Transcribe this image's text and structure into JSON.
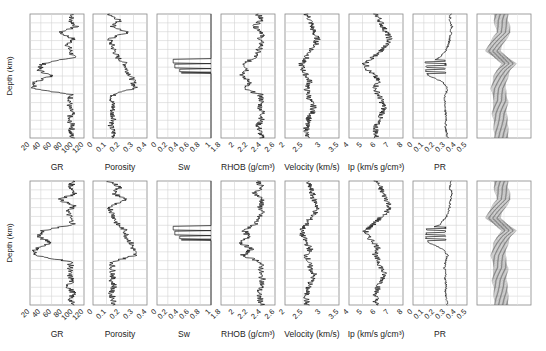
{
  "chart_data": {
    "type": "line",
    "title": "",
    "layout": {
      "rows": 2,
      "columns": 8,
      "grid": true,
      "legend": "none",
      "ylabel": "Depth (km)",
      "y_reversed": true
    },
    "tracks": [
      {
        "name": "GR",
        "xlabel": "GR",
        "xlim": [
          20,
          120
        ],
        "ticks": [
          "20",
          "40",
          "60",
          "80",
          "100",
          "120"
        ]
      },
      {
        "name": "Porosity",
        "xlabel": "Porosity",
        "xlim": [
          0,
          0.4
        ],
        "ticks": [
          "0",
          "0.1",
          "0.2",
          "0.3",
          "0.4"
        ]
      },
      {
        "name": "Sw",
        "xlabel": "Sw",
        "xlim": [
          0,
          1
        ],
        "ticks": [
          "0",
          "0.2",
          "0.4",
          "0.6",
          "0.8",
          "1"
        ]
      },
      {
        "name": "RHOB",
        "xlabel": "RHOB (g/cm³)",
        "xlim": [
          1.8,
          2.6
        ],
        "ticks": [
          "1.8",
          "2",
          "2.2",
          "2.4",
          "2.6"
        ]
      },
      {
        "name": "Velocity",
        "xlabel": "Velocity (km/s)",
        "xlim": [
          2,
          3.5
        ],
        "ticks": [
          "2",
          "2.5",
          "3",
          "3.5"
        ]
      },
      {
        "name": "Ip",
        "xlabel": "Ip (km/s g/cm³)",
        "xlim": [
          4,
          8
        ],
        "ticks": [
          "4",
          "5",
          "6",
          "7",
          "8"
        ]
      },
      {
        "name": "PR",
        "xlabel": "PR",
        "xlim": [
          0,
          0.5
        ],
        "ticks": [
          "0",
          "0.1",
          "0.2",
          "0.3",
          "0.4",
          "0.5"
        ]
      },
      {
        "name": "Seismic",
        "xlabel": "",
        "xlim": [
          0,
          1
        ],
        "ticks": []
      }
    ],
    "depth_samples_normalized": [
      0.0,
      0.05,
      0.1,
      0.15,
      0.2,
      0.25,
      0.3,
      0.35,
      0.4,
      0.45,
      0.5,
      0.55,
      0.6,
      0.65,
      0.7,
      0.75,
      0.8,
      0.85,
      0.9,
      0.95,
      1.0
    ],
    "series": [
      {
        "name": "GR",
        "values": [
          100,
          95,
          105,
          75,
          100,
          90,
          95,
          100,
          45,
          35,
          60,
          30,
          28,
          95,
          95,
          92,
          98,
          90,
          100,
          95,
          98
        ]
      },
      {
        "name": "Porosity",
        "values": [
          0.12,
          0.2,
          0.15,
          0.25,
          0.12,
          0.14,
          0.16,
          0.18,
          0.24,
          0.25,
          0.28,
          0.3,
          0.31,
          0.15,
          0.14,
          0.15,
          0.14,
          0.16,
          0.13,
          0.15,
          0.16
        ]
      },
      {
        "name": "Sw",
        "values": [
          1,
          1,
          1,
          1,
          1,
          1,
          1,
          1,
          1,
          0.25,
          0.35,
          1,
          0.4,
          1,
          1,
          1,
          1,
          1,
          1,
          1,
          1
        ]
      },
      {
        "name": "RHOB",
        "values": [
          2.35,
          2.4,
          2.3,
          2.42,
          2.38,
          2.4,
          2.35,
          2.3,
          2.15,
          2.2,
          2.1,
          2.25,
          2.12,
          2.38,
          2.4,
          2.38,
          2.42,
          2.4,
          2.35,
          2.38,
          2.4
        ]
      },
      {
        "name": "Velocity",
        "values": [
          2.6,
          2.7,
          2.75,
          2.8,
          2.9,
          2.85,
          2.7,
          2.6,
          2.45,
          2.5,
          2.6,
          2.7,
          2.6,
          2.65,
          2.7,
          2.8,
          2.75,
          2.65,
          2.6,
          2.6,
          2.6
        ]
      },
      {
        "name": "Ip",
        "values": [
          6,
          6.3,
          6.5,
          6.8,
          7,
          6.8,
          6.3,
          5.8,
          5.2,
          5.4,
          5.9,
          6.2,
          5.9,
          6.2,
          6.4,
          6.6,
          6.5,
          6.2,
          6,
          6,
          6
        ]
      },
      {
        "name": "PR",
        "values": [
          0.35,
          0.34,
          0.36,
          0.35,
          0.34,
          0.33,
          0.3,
          0.25,
          0.12,
          0.1,
          0.15,
          0.28,
          0.32,
          0.3,
          0.29,
          0.3,
          0.3,
          0.31,
          0.3,
          0.31,
          0.32
        ]
      },
      {
        "name": "Seismic",
        "values": [
          0.45,
          0.45,
          0.48,
          0.5,
          0.42,
          0.35,
          0.3,
          0.45,
          0.6,
          0.5,
          0.45,
          0.42,
          0.4,
          0.42,
          0.45,
          0.43,
          0.42,
          0.44,
          0.45,
          0.45,
          0.46
        ]
      }
    ],
    "rows": [
      {
        "row": "top",
        "sw_spikes": [
          [
            0.35,
            1.0
          ],
          [
            0.25,
            1.0
          ],
          [
            0.4,
            1.0
          ]
        ]
      },
      {
        "row": "bottom",
        "sw_spikes": [
          [
            0.25,
            1.0
          ],
          [
            0.35,
            1.0
          ],
          [
            0.4,
            1.0
          ]
        ]
      }
    ]
  },
  "labels": {
    "depth_axis": "Depth (km)",
    "track_titles": [
      "GR",
      "Porosity",
      "Sw",
      "RHOB (g/cm³)",
      "Velocity (km/s)",
      "Ip (km/s g/cm³)",
      "PR",
      ""
    ]
  }
}
